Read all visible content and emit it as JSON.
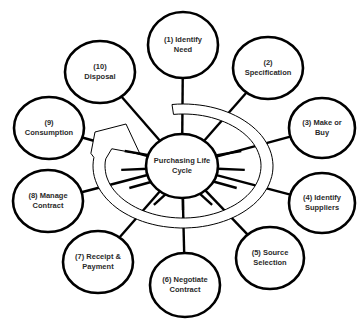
{
  "diagram": {
    "title": "Purchasing Life Cycle",
    "center": {
      "label_line1": "Purchasing Life",
      "label_line2": "Cycle",
      "cx": 182,
      "cy": 166,
      "rx": 36,
      "ry": 32
    },
    "stages": [
      {
        "id": 1,
        "line1": "(1) Identify",
        "line2": "Need",
        "cx": 183,
        "cy": 45,
        "rx": 35,
        "ry": 33
      },
      {
        "id": 2,
        "line1": "(2)",
        "line2": "Specification",
        "cx": 268,
        "cy": 68,
        "rx": 35,
        "ry": 31
      },
      {
        "id": 3,
        "line1": "(3) Make or",
        "line2": "Buy",
        "cx": 322,
        "cy": 128,
        "rx": 33,
        "ry": 30
      },
      {
        "id": 4,
        "line1": "(4) Identify",
        "line2": "Suppliers",
        "cx": 322,
        "cy": 203,
        "rx": 33,
        "ry": 30
      },
      {
        "id": 5,
        "line1": "(5) Source",
        "line2": "Selection",
        "cx": 270,
        "cy": 258,
        "rx": 34,
        "ry": 31
      },
      {
        "id": 6,
        "line1": "(6) Negotiate",
        "line2": "Contract",
        "cx": 185,
        "cy": 285,
        "rx": 35,
        "ry": 32
      },
      {
        "id": 7,
        "line1": "(7) Receipt &",
        "line2": "Payment",
        "cx": 98,
        "cy": 262,
        "rx": 35,
        "ry": 31
      },
      {
        "id": 8,
        "line1": "(8) Manage",
        "line2": "Contract",
        "cx": 48,
        "cy": 201,
        "rx": 35,
        "ry": 31
      },
      {
        "id": 9,
        "line1": "(9)",
        "line2": "Consumption",
        "cx": 49,
        "cy": 128,
        "rx": 35,
        "ry": 31
      },
      {
        "id": 10,
        "line1": "(10)",
        "line2": "Disposal",
        "cx": 100,
        "cy": 72,
        "rx": 35,
        "ry": 31
      }
    ],
    "colors": {
      "stroke": "#000000",
      "fill": "#ffffff",
      "text": "#2a2a2a"
    },
    "cycle_arrow": {
      "direction": "clockwise",
      "description": "hollow curved arrow circling the center, arrowhead pointing toward the center from the left"
    }
  }
}
